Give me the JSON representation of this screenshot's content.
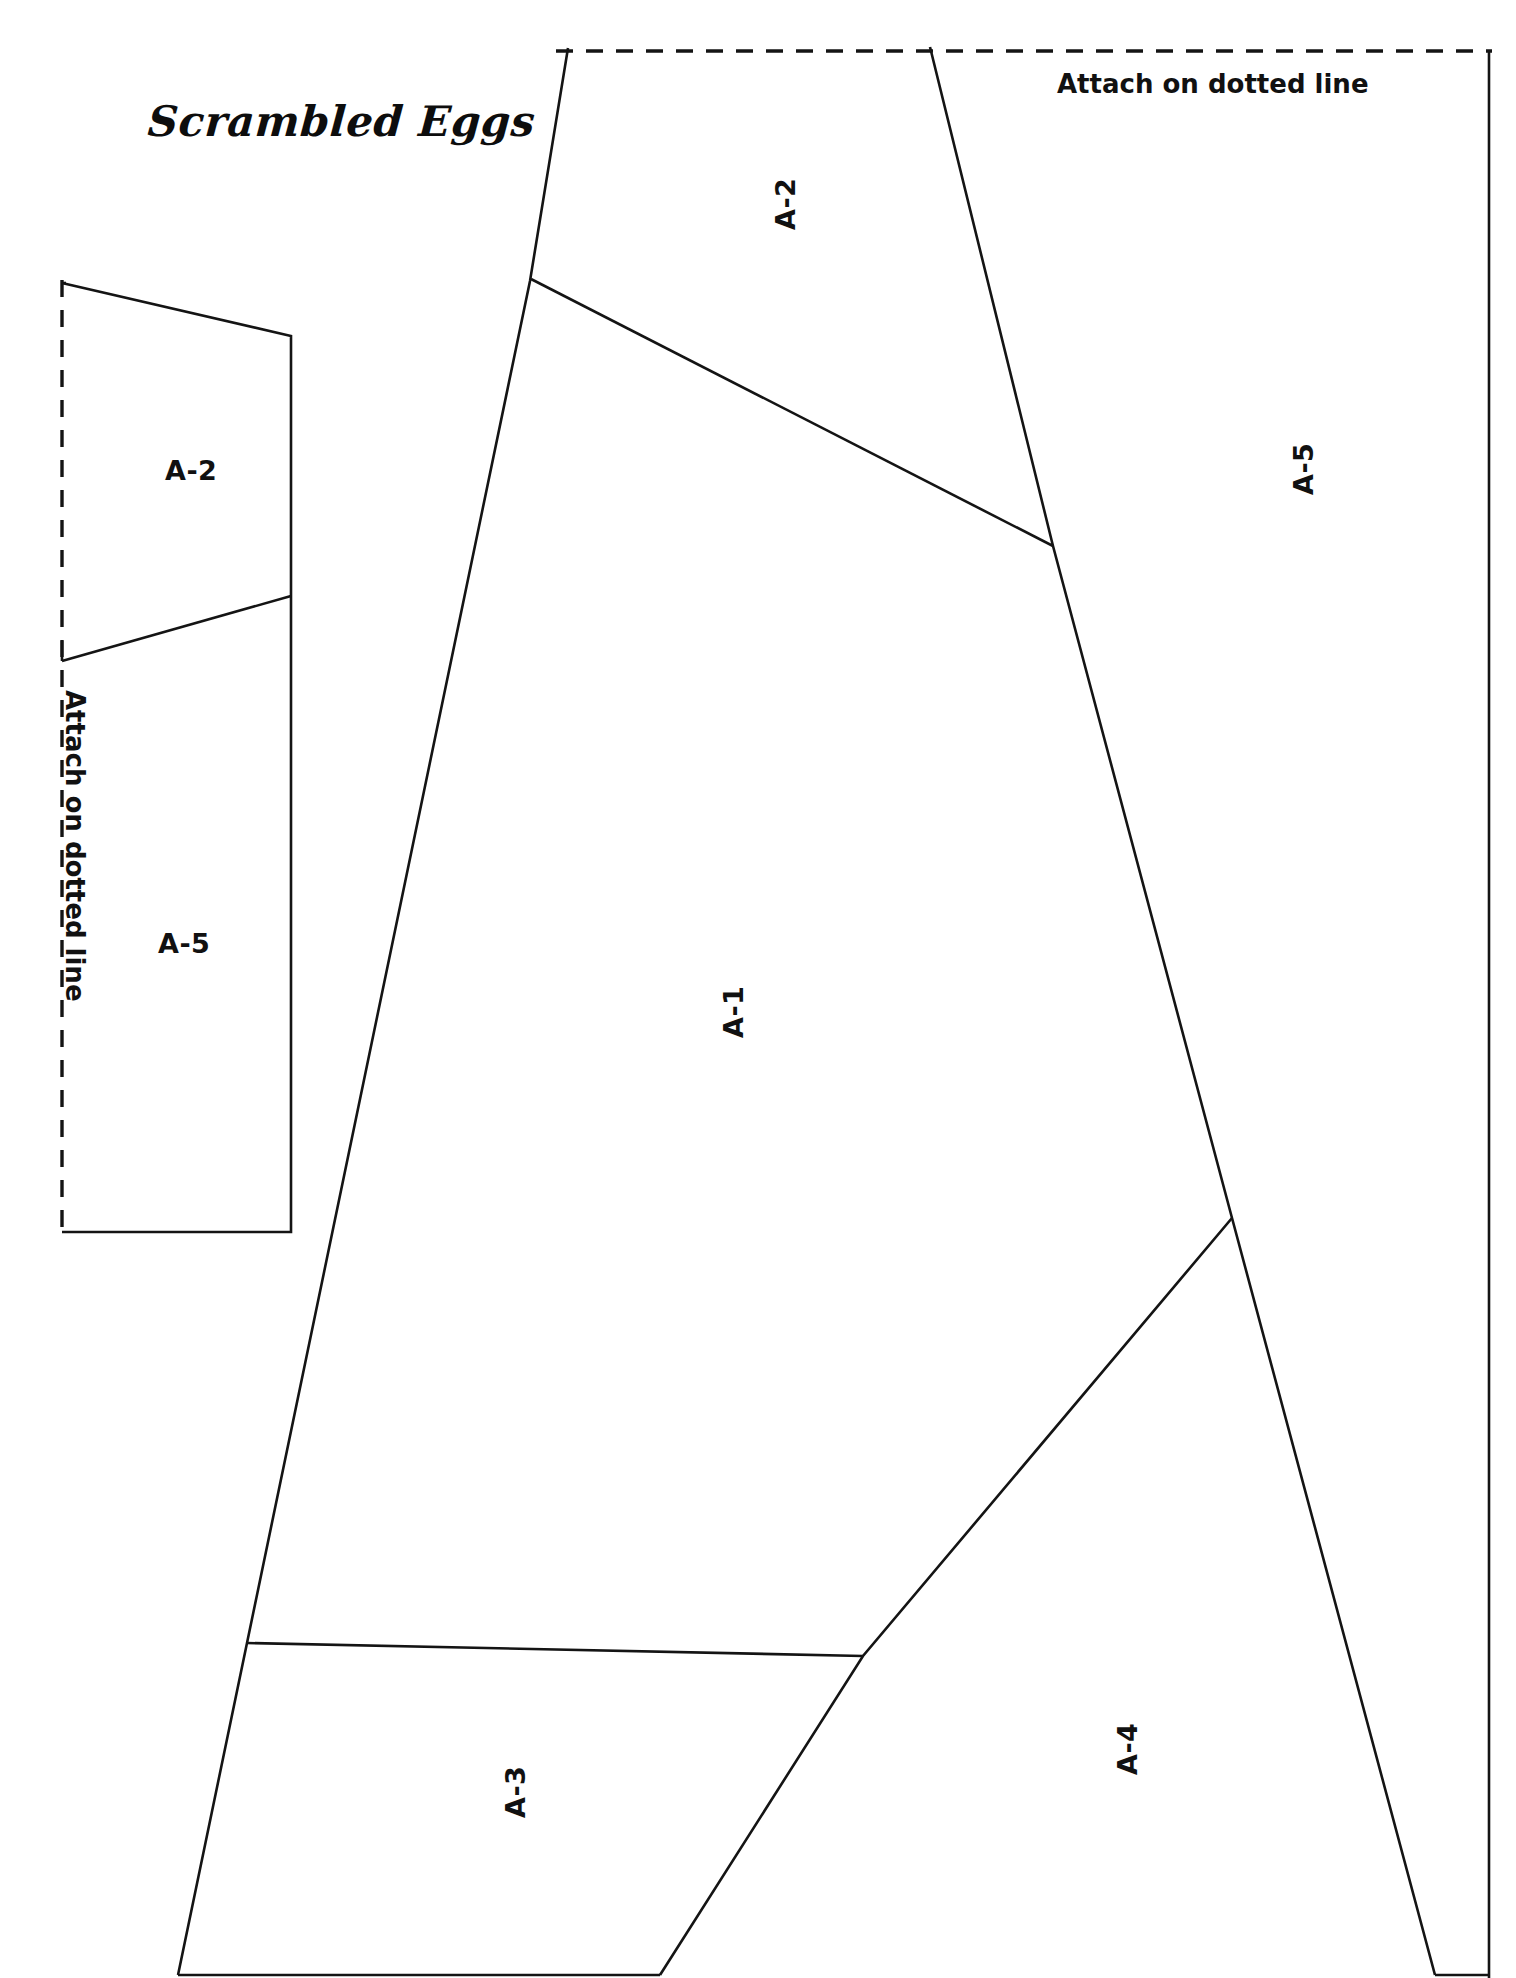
{
  "document": {
    "title": "Scrambled Eggs",
    "kind": "papercraft-pattern-sheet",
    "page_width": 1516,
    "page_height": 1978,
    "background_color": "#ffffff",
    "line_color": "#141414"
  },
  "annotations": {
    "attach_top": "Attach on dotted line",
    "attach_left": "Attach on dotted line"
  },
  "tabs": [
    {
      "id": "left-tab",
      "labels": [
        {
          "text": "A-2",
          "x": 165,
          "y": 455
        },
        {
          "text": "A-5",
          "x": 165,
          "y": 930
        }
      ]
    }
  ],
  "pieces": [
    {
      "id": "A-1",
      "label": "A-1",
      "x": 700,
      "y": 1010,
      "rotated": true
    },
    {
      "id": "A-2",
      "label": "A-2",
      "x": 755,
      "y": 205,
      "rotated": true
    },
    {
      "id": "A-3",
      "label": "A-3",
      "x": 492,
      "y": 1790,
      "rotated": true
    },
    {
      "id": "A-4",
      "label": "A-4",
      "x": 1105,
      "y": 1745,
      "rotated": true
    },
    {
      "id": "A-5",
      "label": "A-5",
      "x": 1285,
      "y": 465,
      "rotated": true
    },
    {
      "id": "A-2-tab",
      "label": "A-2",
      "x": 165,
      "y": 455,
      "rotated": false
    },
    {
      "id": "A-5-tab",
      "label": "A-5",
      "x": 165,
      "y": 930,
      "rotated": false
    }
  ],
  "geometry": {
    "dotted_top": "M 560,51 L 1490,51",
    "dotted_left": "M 62,280 L 62,1230",
    "outline_main": "M 575,48 L 1062,1978 L 660,1978 L 525,1978 L 178,1978 L 262,1235 L 530,280 Z",
    "left_tab_outline": "M 62,282 L 290,333 L 290,1232 L 62,1232"
  }
}
